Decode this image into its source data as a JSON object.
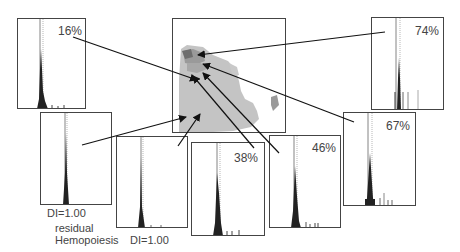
{
  "figure": {
    "central_image": {
      "label": "bone marrow section map"
    },
    "panels": [
      {
        "id": "A",
        "percent": "16%"
      },
      {
        "id": "B",
        "caption": "DI=1.00"
      },
      {
        "id": "C",
        "caption": "DI=1.00"
      },
      {
        "id": "D",
        "percent": "38%"
      },
      {
        "id": "E",
        "percent": "46%"
      },
      {
        "id": "F",
        "percent": "67%"
      },
      {
        "id": "G",
        "percent": "74%"
      }
    ],
    "residual_label_line1": "residual",
    "residual_label_line2": "Hemopoiesis"
  }
}
